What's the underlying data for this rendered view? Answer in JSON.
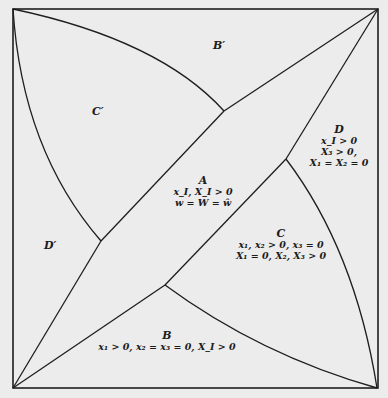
{
  "diagram": {
    "frame": {
      "x1": 13,
      "y1": 9,
      "x2": 378,
      "y2": 388
    },
    "line_color": "#1e1e1e",
    "background": "#ececec",
    "junctions": {
      "top": [
        224,
        111
      ],
      "right": [
        286,
        159
      ],
      "bottom": [
        165,
        285
      ],
      "left": [
        101,
        241
      ]
    }
  },
  "regions": {
    "A": {
      "title": "A",
      "lines": [
        "x_I, X_I > 0",
        "w = W = ŵ"
      ]
    },
    "B": {
      "title": "B",
      "lines": [
        "x₁ > 0, x₂ = x₃ = 0, X_I > 0"
      ]
    },
    "C": {
      "title": "C",
      "lines": [
        "x₁, x₂ > 0, x₃ = 0",
        "X₁ = 0, X₂, X₃ > 0"
      ]
    },
    "D": {
      "title": "D",
      "lines": [
        "x_I > 0",
        "X₃ > 0,",
        "X₁ = X₂ = 0"
      ]
    },
    "B_prime": {
      "title": "B′"
    },
    "C_prime": {
      "title": "C′"
    },
    "D_prime": {
      "title": "D′"
    }
  }
}
